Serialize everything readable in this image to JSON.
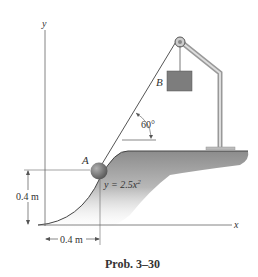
{
  "figure": {
    "caption": "Prob. 3–30",
    "labels": {
      "y_axis": "y",
      "x_axis": "x",
      "ball": "A",
      "block": "B",
      "angle": "60°",
      "curve_equation": "y = 2.5x",
      "curve_exponent": "2",
      "height_dim": "0.4 m",
      "width_dim": "0.4 m"
    },
    "colors": {
      "ground": "#8a8a8a",
      "block": "#7a7a7a",
      "ball": "#6e6e6e",
      "frame": "#c8c8c8",
      "line": "#555555"
    }
  }
}
